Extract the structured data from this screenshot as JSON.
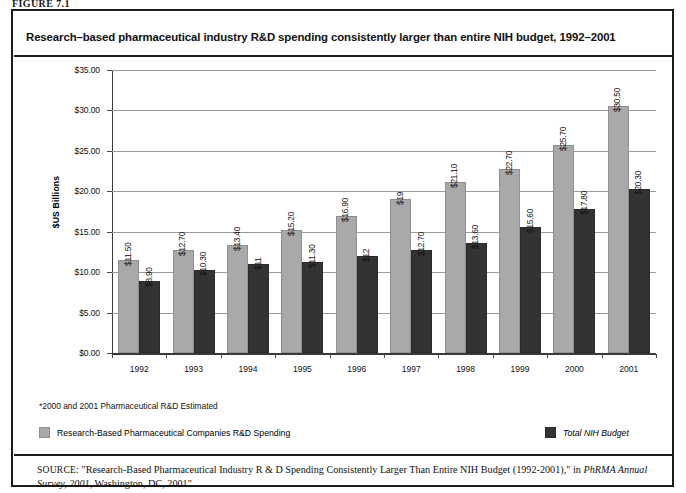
{
  "figure": {
    "label": "FIGURE 7.1"
  },
  "chart_title": "Research–based pharmaceutical industry R&D spending consistently larger than entire NIH budget, 1992–2001",
  "footnote": "*2000 and 2001 Pharmaceutical R&D Estimated",
  "legend": {
    "items": [
      {
        "label": "Research-Based Pharmaceutical Companies R&D Spending",
        "color": "#a9a9a9",
        "style": "normal"
      },
      {
        "label": "Total NIH Budget",
        "color": "#333333",
        "style": "italic"
      }
    ]
  },
  "source": {
    "kicker": "SOURCE:",
    "text_1": " \"Research-Based Pharmaceutical Industry R & D Spending Consistently Larger Than Entire NIH Budget (1992-2001),\" in ",
    "italic_1": "PhRMA Annual Survey, 2001",
    "text_2": ", Washington, DC, 2001\""
  },
  "chart_data": {
    "type": "bar",
    "title": "Research–based pharmaceutical industry R&D spending consistently larger than entire NIH budget, 1992–2001",
    "xlabel": "",
    "ylabel": "$US Billions",
    "ylim": [
      0,
      35
    ],
    "ytick_labels": [
      "$0.00",
      "$5.00",
      "$10.00",
      "$15.00",
      "$20.00",
      "$25.00",
      "$30.00",
      "$35.00"
    ],
    "ytick_values": [
      0,
      5,
      10,
      15,
      20,
      25,
      30,
      35
    ],
    "grid": true,
    "legend_position": "bottom",
    "categories": [
      "1992",
      "1993",
      "1994",
      "1995",
      "1996",
      "1997",
      "1998",
      "1999",
      "2000",
      "2001"
    ],
    "series": [
      {
        "name": "Research-Based Pharmaceutical Companies R&D Spending",
        "color": "#a9a9a9",
        "values": [
          11.5,
          12.7,
          13.4,
          15.2,
          16.9,
          19.0,
          21.1,
          22.7,
          25.7,
          30.5
        ],
        "labels": [
          "$11.50",
          "$12.70",
          "$13.40",
          "$15.20",
          "$16.90",
          "$19",
          "$21.10",
          "$22.70",
          "$25.70",
          "$30.50"
        ]
      },
      {
        "name": "Total NIH Budget",
        "color": "#333333",
        "values": [
          8.9,
          10.3,
          11.0,
          11.3,
          12.0,
          12.7,
          13.6,
          15.6,
          17.8,
          20.3
        ],
        "labels": [
          "$8.90",
          "$10.30",
          "$11",
          "$11.30",
          "$12",
          "$12.70",
          "$13.60",
          "$15.60",
          "$17.80",
          "$20.30"
        ]
      }
    ]
  }
}
